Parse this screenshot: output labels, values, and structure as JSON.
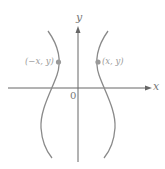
{
  "diagram": {
    "axes": {
      "x_label": "x",
      "y_label": "y",
      "origin_label": "0"
    },
    "points": [
      {
        "label": "(−x, y)",
        "side": "left"
      },
      {
        "label": "(x, y)",
        "side": "right"
      }
    ],
    "colors": {
      "curve": "#8a8a8a",
      "axis": "#666666",
      "point": "#999999"
    }
  }
}
